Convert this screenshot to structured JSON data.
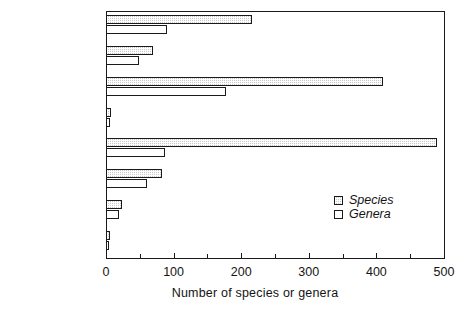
{
  "chart_data": {
    "type": "bar",
    "orientation": "horizontal",
    "title": "",
    "xlabel": "Number of species or genera",
    "ylabel": "",
    "xlim": [
      0,
      500
    ],
    "xticks": [
      0,
      100,
      200,
      300,
      400,
      500
    ],
    "xtick_labels": [
      "0",
      "100",
      "200",
      "300",
      "400",
      "500"
    ],
    "minor_xticks": [
      50,
      150,
      250,
      350,
      450
    ],
    "grid": false,
    "legend_position": "inside-right-lower",
    "categories": [
      "Lichens",
      "Mosses",
      "Vascular plants",
      "Trees",
      "Insects",
      "Land birds",
      "Mammals",
      "Fish"
    ],
    "series": [
      {
        "name": "Species",
        "pattern": "checkered-fill",
        "values": [
          216,
          70,
          410,
          7,
          490,
          83,
          23,
          6
        ]
      },
      {
        "name": "Genera",
        "pattern": "empty-white",
        "values": [
          90,
          49,
          177,
          6,
          87,
          61,
          19,
          5
        ]
      }
    ]
  },
  "legend": {
    "entries": [
      {
        "label": "Species",
        "swatch": "species-swatch"
      },
      {
        "label": "Genera",
        "swatch": "genera-swatch"
      }
    ]
  },
  "colors": {
    "axis": "#1a1a1a",
    "text": "#141414",
    "species_fill": "#c9c9c9",
    "genera_fill": "#ffffff",
    "background": "#ffffff"
  }
}
